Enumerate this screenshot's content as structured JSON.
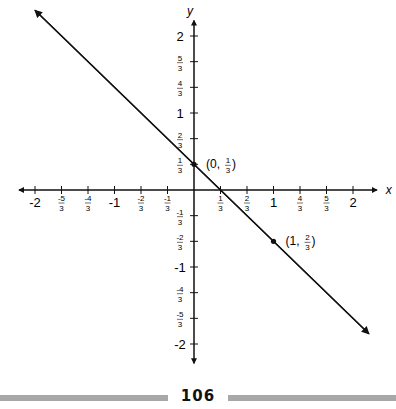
{
  "chart_data": {
    "type": "line",
    "title": "",
    "xlabel": "x",
    "ylabel": "y",
    "xlim": [
      -2,
      2
    ],
    "ylim": [
      -2,
      2
    ],
    "grid": false,
    "x_ticks": [
      "-2",
      "-5/3",
      "-4/3",
      "-1",
      "-2/3",
      "-1/3",
      "1/3",
      "2/3",
      "1",
      "4/3",
      "5/3",
      "2"
    ],
    "y_ticks": [
      "2",
      "5/3",
      "4/3",
      "1",
      "2/3",
      "1/3",
      "-1/3",
      "-2/3",
      "-1",
      "-4/3",
      "-5/3",
      "-2"
    ],
    "series": [
      {
        "name": "line",
        "equation": "y = -x + 1/3",
        "slope": -1,
        "intercept": 0.3333,
        "x": [
          -2.0,
          2.2
        ],
        "y": [
          2.3333,
          -1.8667
        ]
      }
    ],
    "points": [
      {
        "x": 0,
        "y": 0.3333,
        "label": "(0, 1/3)"
      },
      {
        "x": 1,
        "y": -0.6667,
        "label": "(1, -2/3)"
      }
    ]
  },
  "axes": {
    "x_label": "x",
    "y_label": "y"
  },
  "annotations": {
    "p1": "(0,",
    "p1_num": "1",
    "p1_den": "3",
    "p2": "(1,",
    "p2_num": "2",
    "p2_den": "3"
  },
  "footer": {
    "page_number": "106"
  }
}
